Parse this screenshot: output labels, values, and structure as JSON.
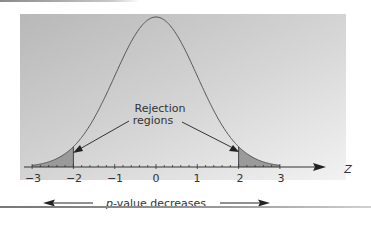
{
  "figure": {
    "annotation": "Rejection regions",
    "annotation_line1": "Rejection",
    "annotation_line2": "regions",
    "axis_label": "Z",
    "bottom_caption_italic": "p",
    "bottom_caption_rest": "-value decreases",
    "tick_labels": [
      "−3",
      "−2",
      "−1",
      "0",
      "1",
      "2",
      "3"
    ],
    "colors": {
      "panel_dark": "#b9b9b9",
      "panel_light": "#f0f0f0",
      "curve": "#555555",
      "shade": "#9a9a9a",
      "axis": "#333333"
    }
  },
  "chart_data": {
    "type": "area",
    "title": "",
    "xlabel": "Z",
    "ylabel": "",
    "xlim": [
      -3,
      3
    ],
    "x_ticks": [
      -3,
      -2,
      -1,
      0,
      1,
      2,
      3
    ],
    "minor_ticks_per_unit": 5,
    "curve": "standard normal density",
    "shaded_regions": [
      {
        "from": -3,
        "to": -2,
        "label": "Rejection regions"
      },
      {
        "from": 2,
        "to": 3,
        "label": "Rejection regions"
      }
    ],
    "annotations": [
      "Rejection regions",
      "p-value decreases"
    ],
    "arrows": [
      {
        "direction": "left",
        "meaning": "p-value decreases"
      },
      {
        "direction": "right",
        "meaning": "p-value decreases"
      }
    ],
    "grid": false,
    "legend": null
  }
}
